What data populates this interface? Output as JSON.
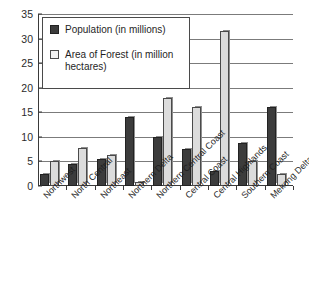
{
  "chart_data": {
    "type": "bar",
    "title": "",
    "xlabel": "",
    "ylabel": "",
    "ylim": [
      0,
      35
    ],
    "yticks": [
      0,
      5,
      10,
      15,
      20,
      25,
      30,
      35
    ],
    "grid": true,
    "legend_position": "upper-left",
    "categories": [
      "Northwest",
      "North Central",
      "Northeast",
      "Northern Delta",
      "Northern Central Coast",
      "Central Coast",
      "Central Highlands",
      "Southern Coast",
      "Mekong Delta"
    ],
    "series": [
      {
        "name": "Population (in millions)",
        "color": "#3c3c3c",
        "values": [
          2.5,
          4.5,
          5.5,
          14.0,
          10.0,
          7.5,
          3.0,
          8.8,
          16.0
        ]
      },
      {
        "name": "Area of Forest (in million hectares)",
        "color": "#dcdcdc",
        "values": [
          5.0,
          7.8,
          6.3,
          0.8,
          18.0,
          16.0,
          31.5,
          5.0,
          2.5
        ]
      }
    ]
  },
  "legend": {
    "items": [
      {
        "label": "Population (in millions)",
        "swatch": "dark-filled-square"
      },
      {
        "label": "Area of Forest (in million hectares)",
        "swatch": "light-outlined-square"
      }
    ]
  },
  "axis": {
    "y_tick_labels": [
      "0",
      "5",
      "10",
      "15",
      "20",
      "25",
      "30",
      "35"
    ]
  }
}
